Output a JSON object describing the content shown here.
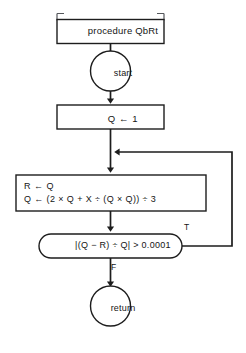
{
  "diagram": {
    "type": "flowchart",
    "title": "procedure QbRt",
    "nodes": {
      "procedure_header": {
        "shape": "bracketed-box",
        "label": "procedure QbRt"
      },
      "start": {
        "shape": "circle",
        "label": "start"
      },
      "initialize": {
        "shape": "rectangle",
        "label": "Q ← 1"
      },
      "compute": {
        "shape": "rectangle",
        "line1": "R ← Q",
        "line2": "Q ← (2 × Q + X ÷ (Q × Q)) ÷ 3"
      },
      "condition": {
        "shape": "stadium",
        "label": "|(Q − R) ÷ Q| > 0.0001"
      },
      "return": {
        "shape": "circle",
        "label": "return"
      }
    },
    "branch_labels": {
      "true": "T",
      "false": "F"
    },
    "colors": {
      "stroke": "#1d1d1d",
      "bracket": "#55585c",
      "background": "#ffffff",
      "text": "#151515"
    }
  }
}
